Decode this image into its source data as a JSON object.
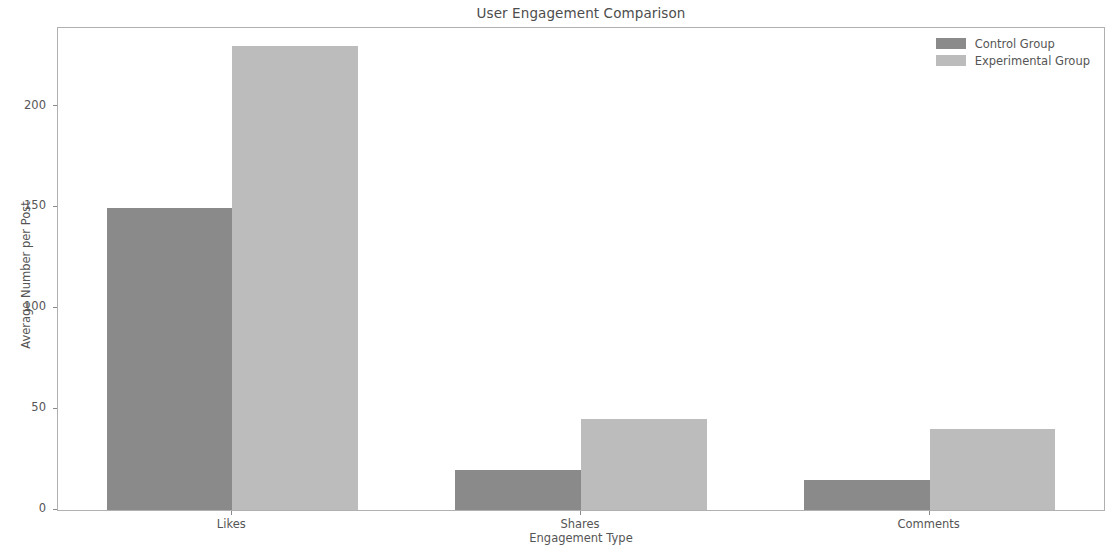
{
  "chart_data": {
    "type": "bar",
    "title": "User Engagement Comparison",
    "xlabel": "Engagement Type",
    "ylabel": "Average Number per Post",
    "categories": [
      "Likes",
      "Shares",
      "Comments"
    ],
    "series": [
      {
        "name": "Control Group",
        "values": [
          150,
          20,
          15
        ],
        "color": "#8a8a8a"
      },
      {
        "name": "Experimental Group",
        "values": [
          230,
          45,
          40
        ],
        "color": "#bcbcbc"
      }
    ],
    "ylim": [
      0,
      239
    ],
    "yticks": [
      0,
      50,
      100,
      150,
      200
    ],
    "ytick_labels": [
      "0",
      "50",
      "100",
      "150",
      "200"
    ],
    "grid": false,
    "legend_position": "upper right",
    "background": "#ffffff",
    "axis_color": "#b0b0b0",
    "text_color": "#555555"
  }
}
